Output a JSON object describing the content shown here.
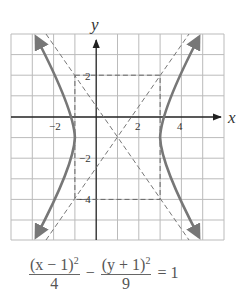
{
  "graph": {
    "x_axis_label": "x",
    "y_axis_label": "y",
    "x_range": [
      -4,
      6
    ],
    "y_range": [
      -6,
      4
    ],
    "x_tick_labels": [
      "−2",
      "2",
      "4"
    ],
    "y_tick_labels": [
      "2",
      "−2",
      "−4"
    ],
    "curve_color": "#777777",
    "grid_color": "#bbbbbb"
  },
  "equation": {
    "left_num_base": "(x − 1)",
    "left_num_exp": "2",
    "left_den": "4",
    "minus": "−",
    "right_num_base": "(y + 1)",
    "right_num_exp": "2",
    "right_den": "9",
    "equals": "= 1"
  }
}
